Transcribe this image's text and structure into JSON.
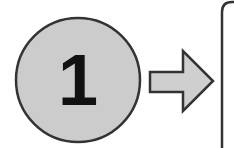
{
  "diagram": {
    "step": {
      "number": "1",
      "fill": "#cccccc",
      "stroke": "#333333"
    },
    "arrow": {
      "direction": "right",
      "fill": "#cfcfcf",
      "stroke": "#333333"
    },
    "panel": {
      "stroke": "#333333",
      "fill": "#ffffff"
    }
  }
}
